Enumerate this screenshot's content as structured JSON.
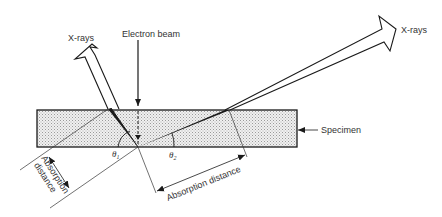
{
  "figure": {
    "labels": {
      "xrays_left": "X-rays",
      "xrays_right": "X-rays",
      "electron_beam": "Electron beam",
      "specimen": "Specimen",
      "absorption_distance_bottom": "Absorption distance",
      "absorption_distance_left_line1": "Absorption",
      "absorption_distance_left_line2": "distance",
      "theta1": "θ",
      "theta1_sub": "1",
      "theta2": "θ",
      "theta2_sub": "2"
    },
    "colors": {
      "line": "#1a1a1a",
      "specimen_fill": "#d9d9d9",
      "text": "#333333"
    }
  }
}
